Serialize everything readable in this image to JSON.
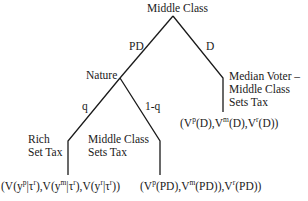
{
  "diagram": {
    "type": "game-tree",
    "root": {
      "label": "Middle Class",
      "branches": [
        {
          "label": "PD",
          "to": "nature"
        },
        {
          "label": "D",
          "to": "median_voter"
        }
      ]
    },
    "nature": {
      "label": "Nature",
      "branches": [
        {
          "label": "q",
          "to": "rich"
        },
        {
          "label": "1-q",
          "to": "middle_class_sets_tax"
        }
      ]
    },
    "median_voter": {
      "label_lines": [
        "Median Voter –",
        "Middle Class",
        "Sets Tax"
      ],
      "payoff": {
        "p1": "(V",
        "sup1": "p",
        "t1": "(D),V",
        "sup2": "m",
        "t2": "(D),V",
        "sup3": "r",
        "t3": "(D))"
      }
    },
    "rich": {
      "label_lines": [
        "Rich",
        "Set Tax"
      ],
      "payoff": {
        "p1": "(V(y",
        "sup1": "p",
        "t1": "|τ",
        "sup1b": "r",
        "t1b": "),V(y",
        "sup2": "m",
        "t2": "|τ",
        "sup2b": "r",
        "t2b": "),V(y",
        "sup3": "r",
        "t3": "|τ",
        "sup3b": "r",
        "t3b": "))"
      }
    },
    "middle_class_sets_tax": {
      "label_lines": [
        "Middle Class",
        "Sets Tax"
      ],
      "payoff": {
        "p1": "(V",
        "sup1": "p",
        "t1": "(PD),V",
        "sup2": "m",
        "t2": "(PD)),V",
        "sup3": "r",
        "t3": "(PD))"
      }
    }
  }
}
